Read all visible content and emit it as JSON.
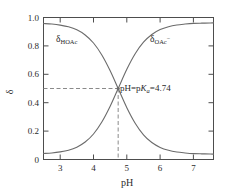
{
  "chart_data": {
    "type": "line",
    "title": "",
    "subtitle": "",
    "xlabel": "pH",
    "ylabel": "δ",
    "xlim": [
      2.5,
      7.6
    ],
    "ylim": [
      -0.04,
      1.04
    ],
    "xticks": [
      3,
      4,
      5,
      6,
      7
    ],
    "xticklabels": [
      "3",
      "4",
      "5",
      "6",
      "7"
    ],
    "yticks": [
      0,
      0.2,
      0.4,
      0.6,
      0.8,
      1.0
    ],
    "yticklabels": [
      "0",
      "0.2",
      "0.4",
      "0.6",
      "0.8",
      "1.0"
    ],
    "grid": false,
    "legend": "inline-labels",
    "pKa": 4.74,
    "series": [
      {
        "name": "δHOAc",
        "label_base": "δ",
        "label_sub": "HOAc",
        "label_sup": "",
        "x": [
          2.5,
          2.75,
          3.0,
          3.25,
          3.5,
          3.75,
          4.0,
          4.25,
          4.5,
          4.74,
          5.0,
          5.25,
          5.5,
          5.75,
          6.0,
          6.25,
          6.5,
          6.75,
          7.0,
          7.25,
          7.5,
          7.6
        ],
        "values": [
          0.994,
          0.99,
          0.982,
          0.969,
          0.946,
          0.907,
          0.846,
          0.755,
          0.635,
          0.5,
          0.354,
          0.236,
          0.148,
          0.089,
          0.052,
          0.03,
          0.017,
          0.01,
          0.005,
          0.003,
          0.002,
          0.001
        ]
      },
      {
        "name": "δOAc⁻",
        "label_base": "δ",
        "label_sub": "OAc",
        "label_sup": "−",
        "x": [
          2.5,
          2.75,
          3.0,
          3.25,
          3.5,
          3.75,
          4.0,
          4.25,
          4.5,
          4.74,
          5.0,
          5.25,
          5.5,
          5.75,
          6.0,
          6.25,
          6.5,
          6.75,
          7.0,
          7.25,
          7.5,
          7.6
        ],
        "values": [
          0.006,
          0.01,
          0.018,
          0.031,
          0.054,
          0.093,
          0.154,
          0.245,
          0.365,
          0.5,
          0.646,
          0.764,
          0.852,
          0.911,
          0.948,
          0.97,
          0.983,
          0.99,
          0.995,
          0.997,
          0.998,
          0.999
        ]
      }
    ],
    "annotations": [
      {
        "name": "pka-annotation",
        "text": "pH=pKa=4.74",
        "prefix": "pH=p",
        "italic": "K",
        "subscript": "a",
        "suffix": "=4.74",
        "x": 4.74,
        "y": 0.5
      }
    ],
    "guides": [
      {
        "name": "horizontal-guide",
        "orientation": "horizontal",
        "value": 0.5,
        "style": "dashed"
      },
      {
        "name": "vertical-guide",
        "orientation": "vertical",
        "value": 4.74,
        "style": "dashed"
      }
    ],
    "colors": {
      "curve": "#6b6b6b",
      "axis": "#4d4d4d",
      "guide": "#8a8a8a",
      "text": "#2b2b2b",
      "background": "#ffffff"
    }
  }
}
